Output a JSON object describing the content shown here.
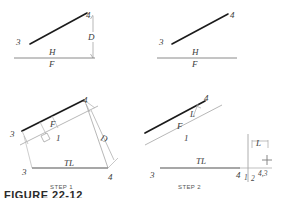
{
  "figure": {
    "caption": "FIGURE 22-12",
    "colors": {
      "heavy_line": "#1b1b1b",
      "thin_line": "#8a8a8a",
      "light_line": "#b5b5b5",
      "text": "#3b3b3b",
      "background": "#ffffff"
    }
  },
  "panels": [
    {
      "id": "top-left",
      "name": "given-front-view-left",
      "labels": {
        "point_3": "3",
        "point_4": "4",
        "dimension_d": "D",
        "ref_h": "H",
        "ref_f": "F"
      }
    },
    {
      "id": "top-right",
      "name": "given-front-view-right",
      "labels": {
        "point_3": "3",
        "point_4": "4",
        "ref_h": "H",
        "ref_f": "F"
      }
    },
    {
      "id": "step-1",
      "name": "step-one-auxiliary-true-length",
      "step_label": "STEP 1",
      "labels": {
        "point_3_upper": "3",
        "point_4_upper": "4",
        "point_3_lower": "3",
        "point_4_lower": "4",
        "ref_f": "F",
        "ref_1": "1",
        "true_length": "TL",
        "dimension_d": "D"
      }
    },
    {
      "id": "step-2",
      "name": "step-two-point-view",
      "step_label": "STEP 2",
      "labels": {
        "point_4_upper": "4",
        "ref_f": "F",
        "ref_1": "1",
        "ref_l": "L",
        "true_length": "TL",
        "point_3_lower": "3",
        "point_4_lower": "4",
        "ref_1_right": "1",
        "ref_2_right": "2",
        "point_view": "4,3",
        "dimension_l": "L"
      }
    }
  ]
}
